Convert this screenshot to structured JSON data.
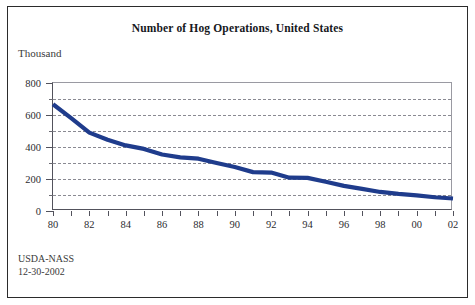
{
  "figure": {
    "title": "Number of Hog Operations, United States",
    "unit_label": "Thousand",
    "source": "USDA-NASS",
    "date": "12-30-2002",
    "line_color": "#1f3c8c",
    "frame_color": "#2b2b2b"
  },
  "chart_data": {
    "type": "line",
    "title": "Number of Hog Operations, United States",
    "xlabel": "",
    "ylabel": "Thousand",
    "ylim": [
      0,
      800
    ],
    "xlim": [
      1980,
      2002
    ],
    "yticks": [
      0,
      200,
      400,
      600,
      800
    ],
    "ytick_labels": [
      "0",
      "200",
      "400",
      "600",
      "800"
    ],
    "yminor_ticks": [
      100,
      300,
      500,
      700
    ],
    "grid": true,
    "grid_style": "dashed-horizontal",
    "legend": "none",
    "x": [
      1980,
      1981,
      1982,
      1983,
      1984,
      1985,
      1986,
      1987,
      1988,
      1989,
      1990,
      1991,
      1992,
      1993,
      1994,
      1995,
      1996,
      1997,
      1998,
      1999,
      2000,
      2001,
      2002
    ],
    "xtick_labels": [
      "80",
      "81",
      "82",
      "83",
      "84",
      "85",
      "86",
      "87",
      "88",
      "89",
      "90",
      "91",
      "92",
      "93",
      "94",
      "95",
      "96",
      "97",
      "98",
      "99",
      "00",
      "01",
      "02"
    ],
    "xtick_labels_shown": [
      "80",
      "82",
      "84",
      "86",
      "88",
      "90",
      "92",
      "94",
      "96",
      "98",
      "00",
      "02"
    ],
    "series": [
      {
        "name": "Hog operations",
        "color": "#1f3c8c",
        "values": [
          667,
          580,
          490,
          445,
          410,
          388,
          353,
          335,
          327,
          300,
          275,
          243,
          240,
          208,
          207,
          183,
          157,
          138,
          119,
          107,
          98,
          86,
          78
        ]
      }
    ]
  }
}
